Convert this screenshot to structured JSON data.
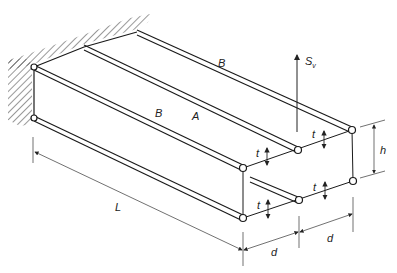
{
  "figure": {
    "labels": {
      "panel_top_far": "B",
      "panel_front": "B",
      "panel_middle": "A",
      "load": "S",
      "load_subscript": "v",
      "length": "L",
      "height": "h",
      "width_left": "d",
      "width_right": "d",
      "thickness_1": "t",
      "thickness_2": "t",
      "thickness_3": "t",
      "thickness_4": "t"
    },
    "colors": {
      "line": "#1a1a1a",
      "dimension": "#333333",
      "background": "#ffffff"
    }
  }
}
